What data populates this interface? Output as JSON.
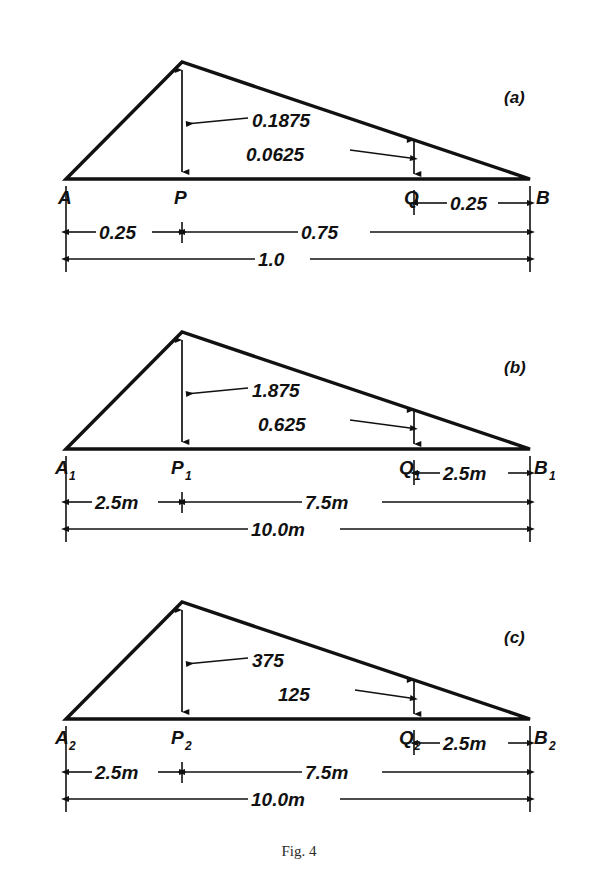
{
  "figure": {
    "caption": "Fig. 4",
    "panels": [
      {
        "tag": "(a)",
        "points": {
          "left": "A",
          "mid": "P",
          "right_inner": "Q",
          "right": "B",
          "left_sub": "",
          "mid_sub": "",
          "right_inner_sub": "",
          "right_sub": ""
        },
        "ordinates": {
          "major": "0.1875",
          "minor": "0.0625"
        },
        "dimensions": {
          "q_to_b": "0.25",
          "a_to_p": "0.25",
          "p_to_b": "0.75",
          "a_to_b": "1.0"
        }
      },
      {
        "tag": "(b)",
        "points": {
          "left": "A",
          "mid": "P",
          "right_inner": "Q",
          "right": "B",
          "left_sub": "1",
          "mid_sub": "1",
          "right_inner_sub": "1",
          "right_sub": "1"
        },
        "ordinates": {
          "major": "1.875",
          "minor": "0.625"
        },
        "dimensions": {
          "q_to_b": "2.5m",
          "a_to_p": "2.5m",
          "p_to_b": "7.5m",
          "a_to_b": "10.0m"
        }
      },
      {
        "tag": "(c)",
        "points": {
          "left": "A",
          "mid": "P",
          "right_inner": "Q",
          "right": "B",
          "left_sub": "2",
          "mid_sub": "2",
          "right_inner_sub": "2",
          "right_sub": "2"
        },
        "ordinates": {
          "major": "375",
          "minor": "125"
        },
        "dimensions": {
          "q_to_b": "2.5m",
          "a_to_p": "2.5m",
          "p_to_b": "7.5m",
          "a_to_b": "10.0m"
        }
      }
    ],
    "colors": {
      "ink": "#111111",
      "background": "#ffffff",
      "caption_ink": "#2a2a2a"
    }
  }
}
